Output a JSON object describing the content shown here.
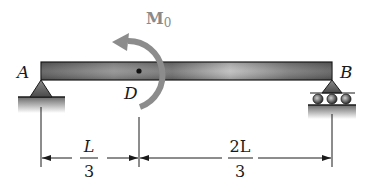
{
  "diagram": {
    "type": "simply-supported-beam",
    "beam": {
      "x1": 41,
      "x2": 332,
      "y1": 62,
      "y2": 80
    },
    "points": {
      "A": {
        "label": "A",
        "x": 41
      },
      "B": {
        "label": "B",
        "x": 332
      },
      "D": {
        "label": "D",
        "x": 139
      }
    },
    "load": {
      "label_main": "M",
      "label_sub": "0",
      "kind": "couple-moment",
      "direction": "counterclockwise",
      "color": "#8c8c8c"
    },
    "supports": {
      "left": {
        "kind": "pin",
        "at": "A"
      },
      "right": {
        "kind": "roller",
        "at": "B",
        "roller_count": 3
      }
    },
    "dimensions": [
      {
        "from": "A",
        "to": "D",
        "numerator": "L",
        "denominator": "3"
      },
      {
        "from": "D",
        "to": "B",
        "numerator": "2L",
        "denominator": "3"
      }
    ],
    "colors": {
      "beam_dark": "#3a3a3a",
      "beam_light": "#c8c8c8",
      "line": "#1a1a1a",
      "moment": "#8c8c8c"
    }
  }
}
